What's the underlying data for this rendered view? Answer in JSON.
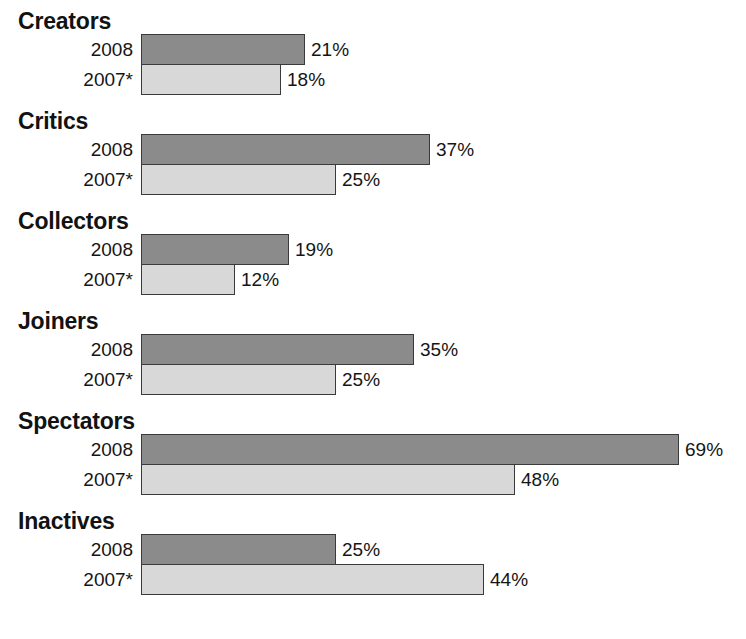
{
  "chart_data": {
    "type": "bar",
    "orientation": "horizontal",
    "title": "",
    "subtitle": "",
    "xlabel": "",
    "ylabel": "",
    "xlim": [
      0,
      75
    ],
    "grid": false,
    "legend_position": "none",
    "value_suffix": "%",
    "categories": [
      "Creators",
      "Critics",
      "Collectors",
      "Joiners",
      "Spectators",
      "Inactives"
    ],
    "series": [
      {
        "name": "2008",
        "color": "#8b8b8b",
        "values": [
          21,
          37,
          19,
          35,
          69,
          25
        ],
        "labels": [
          "21%",
          "37%",
          "19%",
          "35%",
          "69%",
          "25%"
        ]
      },
      {
        "name": "2007*",
        "color": "#d8d8d8",
        "values": [
          18,
          25,
          12,
          25,
          48,
          44
        ],
        "labels": [
          "18%",
          "25%",
          "12%",
          "25%",
          "48%",
          "44%"
        ]
      }
    ]
  },
  "groups": [
    {
      "title": "Creators",
      "rows": [
        {
          "label": "2008",
          "value": 21,
          "value_label": "21%",
          "series": "2008"
        },
        {
          "label": "2007*",
          "value": 18,
          "value_label": "18%",
          "series": "2007*"
        }
      ]
    },
    {
      "title": "Critics",
      "rows": [
        {
          "label": "2008",
          "value": 37,
          "value_label": "37%",
          "series": "2008"
        },
        {
          "label": "2007*",
          "value": 25,
          "value_label": "25%",
          "series": "2007*"
        }
      ]
    },
    {
      "title": "Collectors",
      "rows": [
        {
          "label": "2008",
          "value": 19,
          "value_label": "19%",
          "series": "2008"
        },
        {
          "label": "2007*",
          "value": 12,
          "value_label": "12%",
          "series": "2007*"
        }
      ]
    },
    {
      "title": "Joiners",
      "rows": [
        {
          "label": "2008",
          "value": 35,
          "value_label": "35%",
          "series": "2008"
        },
        {
          "label": "2007*",
          "value": 25,
          "value_label": "25%",
          "series": "2007*"
        }
      ]
    },
    {
      "title": "Spectators",
      "rows": [
        {
          "label": "2008",
          "value": 69,
          "value_label": "69%",
          "series": "2008"
        },
        {
          "label": "2007*",
          "value": 48,
          "value_label": "48%",
          "series": "2007*"
        }
      ]
    },
    {
      "title": "Inactives",
      "rows": [
        {
          "label": "2008",
          "value": 25,
          "value_label": "25%",
          "series": "2008"
        },
        {
          "label": "2007*",
          "value": 44,
          "value_label": "44%",
          "series": "2007*"
        }
      ]
    }
  ],
  "layout": {
    "bar_origin_x": 141,
    "px_per_unit": 7.8,
    "bar_height": 31,
    "group_pitch": 100,
    "first_group_top": 8,
    "title_to_bars": 26
  },
  "colors": {
    "series_2008": "#8b8b8b",
    "series_2007": "#d8d8d8",
    "bar_border": "#3a3a3a",
    "text": "#151515",
    "background": "#ffffff"
  }
}
